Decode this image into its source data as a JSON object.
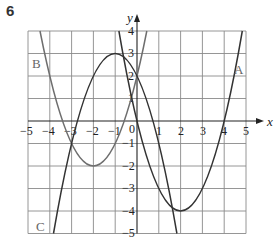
{
  "question_number": "6",
  "axes": {
    "x_label": "x",
    "y_label": "y",
    "x_ticks": [
      "−5",
      "−4",
      "−3",
      "−2",
      "−1",
      "0",
      "1",
      "2",
      "3",
      "4",
      "5"
    ],
    "y_ticks": [
      "4",
      "3",
      "2",
      "1",
      "−1",
      "−2",
      "−3",
      "−4",
      "−5"
    ],
    "x_range": [
      -5,
      5
    ],
    "y_range": [
      -5,
      4
    ]
  },
  "curves": [
    {
      "label": "A",
      "equation": "y = x^2 - 4x",
      "vertex": [
        2,
        -4
      ],
      "color": "#333333"
    },
    {
      "label": "B",
      "equation": "y = (x + 2)^2 - 2",
      "vertex": [
        -2,
        -2
      ],
      "color": "#6e6e6e"
    },
    {
      "label": "C",
      "equation": "y = 3 - (x + 1)^2",
      "vertex": [
        -1,
        3
      ],
      "color": "#333333"
    }
  ],
  "labels": {
    "A": "A",
    "B": "B",
    "C": "C"
  }
}
